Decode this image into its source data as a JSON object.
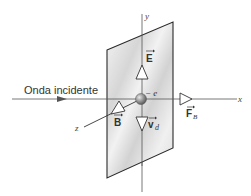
{
  "diagram": {
    "labels": {
      "incident_wave": "Onda incidente",
      "x_axis": "x",
      "y_axis": "y",
      "z_axis": "z",
      "electron": "− e",
      "E_vector": "E",
      "B_vector": "B",
      "v_vector": "v",
      "v_subscript": "d",
      "F_vector": "F",
      "F_subscript": "B"
    },
    "colors": {
      "line": "#333333",
      "axis": "#555555",
      "plate_edge": "#2a2a2a",
      "plate_fill_light": "#f4f4f4",
      "plate_fill_dark": "#cfcfcf",
      "arrow_fill": "#ffffff",
      "electron": "#8a8a8a"
    }
  }
}
